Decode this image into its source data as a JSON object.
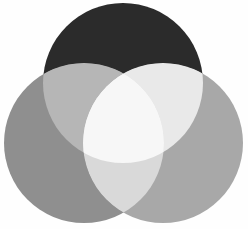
{
  "figure": {
    "type": "venn-3",
    "background_color": "#fefefe",
    "width": 248,
    "height": 229
  },
  "chart_data": {
    "type": "venn",
    "xlabel": "",
    "ylabel": "",
    "grid": false,
    "legend": "none",
    "blend_mode": "lighten-screen",
    "canvas": {
      "width": 248,
      "height": 229,
      "background": "#fefefe"
    },
    "sets": [
      {
        "id": "top",
        "name": "Set A",
        "label": "",
        "color": "#2b2b2b",
        "cx": 123,
        "cy": 83,
        "r": 80,
        "opacity": 1
      },
      {
        "id": "left",
        "name": "Set B",
        "label": "",
        "color": "#8f8f8f",
        "cx": 84,
        "cy": 143,
        "r": 80,
        "opacity": 1
      },
      {
        "id": "right",
        "name": "Set C",
        "label": "",
        "color": "#a8a8a8",
        "cx": 163,
        "cy": 143,
        "r": 80,
        "opacity": 1
      }
    ],
    "regions": [
      {
        "id": "top-only",
        "sets": [
          "top"
        ],
        "color": "#2b2b2b"
      },
      {
        "id": "left-only",
        "sets": [
          "left"
        ],
        "color": "#8f8f8f"
      },
      {
        "id": "right-only",
        "sets": [
          "right"
        ],
        "color": "#a8a8a8"
      },
      {
        "id": "top-left",
        "sets": [
          "top",
          "left"
        ],
        "color": "#b6b6b6"
      },
      {
        "id": "top-right",
        "sets": [
          "top",
          "right"
        ],
        "color": "#e9e9e9"
      },
      {
        "id": "left-right",
        "sets": [
          "left",
          "right"
        ],
        "color": "#d9d9d9"
      },
      {
        "id": "all-three",
        "sets": [
          "top",
          "left",
          "right"
        ],
        "color": "#f7f7f7"
      }
    ]
  }
}
